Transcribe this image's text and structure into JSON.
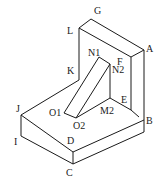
{
  "figure": {
    "labels": {
      "G": "G",
      "L": "L",
      "A": "A",
      "N1": "N1",
      "F": "F",
      "N2": "N2",
      "K": "K",
      "E": "E",
      "J": "J",
      "O1": "O1",
      "M2": "M2",
      "O2": "O2",
      "B": "B",
      "I": "I",
      "D": "D",
      "C": "C"
    },
    "colors": {
      "line": "#1a1a1a",
      "background": "#ffffff"
    }
  }
}
